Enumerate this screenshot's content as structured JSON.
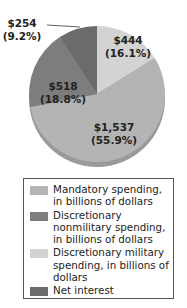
{
  "chart_data": {
    "type": "pie",
    "title": "",
    "slices": [
      {
        "name": "Discretionary military spending, in billions of dollars",
        "value": 444,
        "label": "$444",
        "pct_label": "(16.1%)",
        "percent": 16.1,
        "color": "#d3d3d3"
      },
      {
        "name": "Mandatory spending, in billions of dollars",
        "value": 1537,
        "label": "$1,537",
        "pct_label": "(55.9%)",
        "percent": 55.9,
        "color": "#b4b4b4"
      },
      {
        "name": "Discretionary nonmilitary spending, in billions of dollars",
        "value": 518,
        "label": "$518",
        "pct_label": "(18.8%)",
        "percent": 18.8,
        "color": "#7d7d7d"
      },
      {
        "name": "Net interest",
        "value": 254,
        "label": "$254",
        "pct_label": "(9.2%)",
        "percent": 9.2,
        "color": "#6b6b6b"
      }
    ],
    "legend": {
      "placement": "bottom",
      "entries": [
        {
          "label": "Mandatory spending, in billions of dollars",
          "color": "#b4b4b4"
        },
        {
          "label": "Discretionary nonmilitary spending, in billions of dollars",
          "color": "#7d7d7d"
        },
        {
          "label": "Discretionary military spending, in billions of dollars",
          "color": "#d3d3d3"
        },
        {
          "label": "Net interest",
          "color": "#6b6b6b"
        }
      ]
    }
  }
}
